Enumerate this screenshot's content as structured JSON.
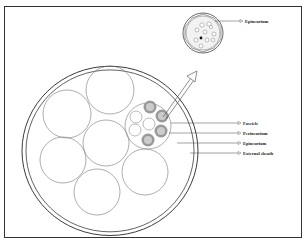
{
  "labels": {
    "inset_epineurium": "Epineurium",
    "fascicle": "Fascicle",
    "perineurium": "Perineurium",
    "epineurium": "Epineurium",
    "external_sheath": "External sheath"
  },
  "colors": {
    "line": "#555555",
    "outline": "#333333",
    "perineurium_fill": "#999999",
    "core_fill": "#cccccc"
  }
}
